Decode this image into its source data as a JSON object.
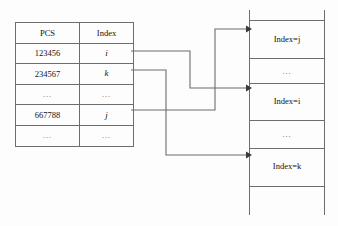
{
  "diagram": {
    "colors": {
      "line": "#6d6d6d",
      "arrow": "#3a3a3a",
      "text": "#111111",
      "background": "#fdfdfd"
    }
  },
  "table": {
    "name": "pcs-index-table",
    "headers": [
      "PCS",
      "Index"
    ],
    "rows": [
      {
        "pcs": "123456",
        "index": "i",
        "index_style": "italic"
      },
      {
        "pcs": "234567",
        "index": "k",
        "index_style": "italic"
      },
      {
        "pcs": "...",
        "index": "...",
        "index_style": "plain"
      },
      {
        "pcs": "667788",
        "index": "j",
        "index_style": "italic"
      },
      {
        "pcs": "...",
        "index": "...",
        "index_style": "plain"
      }
    ]
  },
  "index_block": {
    "name": "index-records-block",
    "cells": [
      {
        "type": "label",
        "text": "Index=j"
      },
      {
        "type": "dots",
        "text": "..."
      },
      {
        "type": "label",
        "text": "Index=i"
      },
      {
        "type": "dots",
        "text": "..."
      },
      {
        "type": "label",
        "text": "Index=k"
      },
      {
        "type": "blank",
        "text": ""
      }
    ]
  },
  "connectors": [
    {
      "name": "connector-i-to-index-i",
      "from_row": "123456",
      "to_cell": "Index=i"
    },
    {
      "name": "connector-k-to-index-k",
      "from_row": "234567",
      "to_cell": "Index=k"
    },
    {
      "name": "connector-j-to-index-j",
      "from_row": "667788",
      "to_cell": "Index=j"
    }
  ]
}
